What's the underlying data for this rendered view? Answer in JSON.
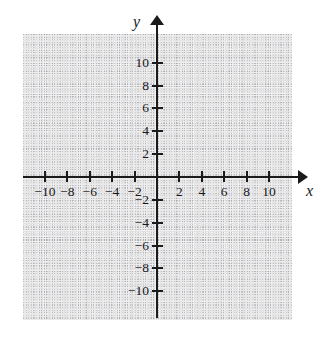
{
  "chart_data": {
    "type": "scatter",
    "title": "",
    "subtitle": "",
    "xlabel": "x",
    "ylabel": "y",
    "xlim": [
      -12,
      12
    ],
    "ylim": [
      -12.5,
      12.5
    ],
    "x_tick_labels": [
      "−10",
      "−8",
      "−6",
      "−4",
      "−2",
      "2",
      "4",
      "6",
      "8",
      "10"
    ],
    "x_tick_values": [
      -10,
      -8,
      -6,
      -4,
      -2,
      2,
      4,
      6,
      8,
      10
    ],
    "y_tick_labels": [
      "10",
      "8",
      "6",
      "4",
      "2",
      "−2",
      "−4",
      "−6",
      "−8",
      "−10"
    ],
    "y_tick_values": [
      10,
      8,
      6,
      4,
      2,
      -2,
      -4,
      -6,
      -8,
      -10
    ],
    "grid": true,
    "grid_style": "dotted",
    "grid_major_step": 2,
    "grid_minor_step": 1,
    "legend": "none",
    "series": [],
    "values": [],
    "categories": [],
    "annotations": [],
    "origin_label": "",
    "axis_arrows": [
      "x-positive",
      "y-positive"
    ],
    "colors": {
      "axis": "#1b1b1b",
      "grid": "#9a9a9f",
      "text": "#17171a",
      "background": "#ffffff"
    }
  }
}
